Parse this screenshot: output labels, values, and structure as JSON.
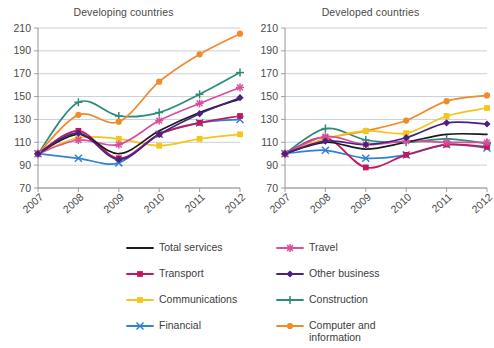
{
  "chart_data": [
    {
      "type": "line",
      "title": "Developing countries",
      "xlabel": "",
      "ylabel": "",
      "x": [
        "2007",
        "2008",
        "2009",
        "2010",
        "2011",
        "2012"
      ],
      "ylim": [
        70,
        210
      ],
      "yticks": [
        70,
        90,
        110,
        130,
        150,
        170,
        190,
        210
      ],
      "grid": true,
      "legend_position": "bottom",
      "series": [
        {
          "name": "Total services",
          "color": "#1a1a1a",
          "marker": "none",
          "values": [
            100,
            117,
            100,
            120,
            136,
            148
          ]
        },
        {
          "name": "Transport",
          "color": "#c2185b",
          "marker": "square",
          "values": [
            100,
            120,
            96,
            117,
            127,
            133
          ]
        },
        {
          "name": "Communications",
          "color": "#f5c518",
          "marker": "square",
          "values": [
            100,
            114,
            113,
            107,
            113,
            117
          ]
        },
        {
          "name": "Financial",
          "color": "#2f80d6",
          "marker": "x",
          "values": [
            100,
            96,
            92,
            117,
            127,
            130
          ]
        },
        {
          "name": "Travel",
          "color": "#d94f9b",
          "marker": "star",
          "values": [
            100,
            112,
            108,
            129,
            144,
            158
          ]
        },
        {
          "name": "Other business",
          "color": "#4a2182",
          "marker": "diamond",
          "values": [
            100,
            118,
            95,
            117,
            135,
            149
          ]
        },
        {
          "name": "Construction",
          "color": "#2e8b7a",
          "marker": "plus",
          "values": [
            100,
            145,
            133,
            136,
            152,
            171
          ]
        },
        {
          "name": "Computer and information",
          "color": "#f08a2b",
          "marker": "circle",
          "values": [
            100,
            134,
            128,
            163,
            187,
            205
          ]
        }
      ]
    },
    {
      "type": "line",
      "title": "Developed countries",
      "xlabel": "",
      "ylabel": "",
      "x": [
        "2007",
        "2008",
        "2009",
        "2010",
        "2011",
        "2012"
      ],
      "ylim": [
        70,
        210
      ],
      "yticks": [
        70,
        90,
        110,
        130,
        150,
        170,
        190,
        210
      ],
      "grid": true,
      "legend_position": "bottom",
      "series": [
        {
          "name": "Total services",
          "color": "#1a1a1a",
          "marker": "none",
          "values": [
            100,
            110,
            104,
            110,
            117,
            117
          ]
        },
        {
          "name": "Transport",
          "color": "#c2185b",
          "marker": "square",
          "values": [
            100,
            114,
            88,
            99,
            108,
            106
          ]
        },
        {
          "name": "Communications",
          "color": "#f5c518",
          "marker": "square",
          "values": [
            100,
            113,
            120,
            118,
            133,
            140
          ]
        },
        {
          "name": "Financial",
          "color": "#2f80d6",
          "marker": "x",
          "values": [
            100,
            103,
            96,
            99,
            108,
            105
          ]
        },
        {
          "name": "Travel",
          "color": "#d94f9b",
          "marker": "star",
          "values": [
            100,
            115,
            108,
            111,
            110,
            110
          ]
        },
        {
          "name": "Other business",
          "color": "#4a2182",
          "marker": "diamond",
          "values": [
            100,
            111,
            108,
            114,
            127,
            126
          ]
        },
        {
          "name": "Construction",
          "color": "#2e8b7a",
          "marker": "plus",
          "values": [
            100,
            122,
            112,
            110,
            113,
            109
          ]
        },
        {
          "name": "Computer and information",
          "color": "#f08a2b",
          "marker": "circle",
          "values": [
            100,
            113,
            120,
            129,
            146,
            151
          ]
        }
      ]
    }
  ],
  "legend": {
    "items": [
      {
        "label": "Total services",
        "color": "#1a1a1a",
        "marker": "none"
      },
      {
        "label": "Travel",
        "color": "#d94f9b",
        "marker": "star"
      },
      {
        "label": "Transport",
        "color": "#c2185b",
        "marker": "square"
      },
      {
        "label": "Other business",
        "color": "#4a2182",
        "marker": "diamond"
      },
      {
        "label": "Communications",
        "color": "#f5c518",
        "marker": "square"
      },
      {
        "label": "Construction",
        "color": "#2e8b7a",
        "marker": "plus"
      },
      {
        "label": "Financial",
        "color": "#2f80d6",
        "marker": "x"
      },
      {
        "label": "Computer and\ninformation",
        "color": "#f08a2b",
        "marker": "circle"
      }
    ]
  },
  "style": {
    "grid_color": "#b8c4d0",
    "axis_color": "#8a8a8a",
    "tick_label_color": "#4a4a4a",
    "title_color": "#4a4a4a",
    "background": "#ffffff"
  }
}
